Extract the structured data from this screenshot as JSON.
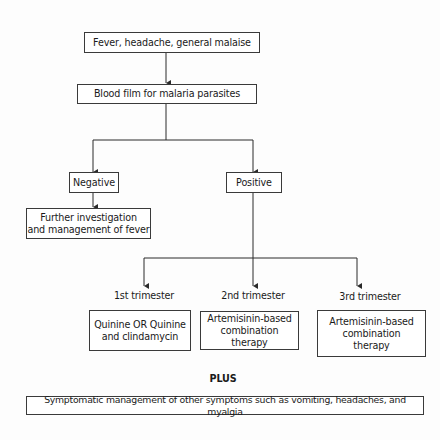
{
  "flowchart": {
    "start": {
      "text": "Fever, headache, general malaise"
    },
    "test": {
      "text": "Blood film for malaria parasites"
    },
    "negative": {
      "label": "Negative",
      "action": "Further investigation\nand management of fever"
    },
    "positive": {
      "label": "Positive",
      "branches": [
        {
          "label": "1st trimester",
          "treatment": "Quinine OR Quinine\nand clindamycin"
        },
        {
          "label": "2nd trimester",
          "treatment": "Artemisinin-based\ncombination therapy"
        },
        {
          "label": "3rd trimester",
          "treatment": "Artemisinin-based\ncombination\ntherapy"
        }
      ]
    },
    "plus_label": "PLUS",
    "supportive": {
      "text": "Symptomatic management of other symptoms such as vomiting, headaches, and myalgia"
    }
  },
  "colors": {
    "line": "#2a2a2a",
    "box_border": "#3a3a3a",
    "background": "#fdfdfd"
  }
}
